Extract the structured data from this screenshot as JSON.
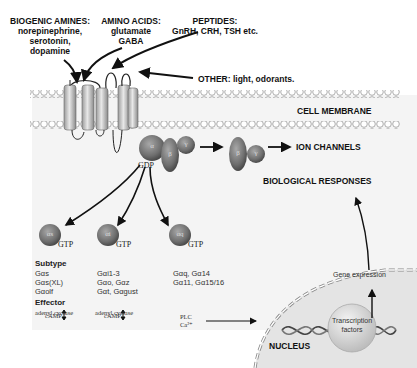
{
  "ligands": {
    "biogenic_amines": {
      "title": "BIOGENIC AMINES:",
      "items": [
        "norepinephrine,",
        "serotonin,",
        "dopamine"
      ]
    },
    "amino_acids": {
      "title": "AMINO ACIDS:",
      "items": [
        "glutamate",
        "GABA"
      ]
    },
    "peptides": {
      "title": "PEPTIDES:",
      "items": [
        "GnRH, CRH, TSH etc."
      ]
    },
    "other": {
      "text": "OTHER: light, odorants."
    }
  },
  "membrane": {
    "label": "CELL MEMBRANE"
  },
  "g_protein": {
    "alpha": "α",
    "beta": "β",
    "gamma": "γ",
    "gdp": "GDP"
  },
  "ion_channels": {
    "label": "ION CHANNELS"
  },
  "alpha_subunits": [
    {
      "symbol": "αs",
      "gtp": "GTP"
    },
    {
      "symbol": "αi",
      "gtp": "GTP"
    },
    {
      "symbol": "αq",
      "gtp": "GTP"
    }
  ],
  "subtype": {
    "heading": "Subtype",
    "columns": [
      [
        "Gαs",
        "Gαs(XL)",
        "Gαolf"
      ],
      [
        "Gαi1-3",
        "Gαo, Gαz",
        "Gαt, Gαgust"
      ],
      [
        "Gαq, Gα14",
        "Gα11, Gα15/16"
      ]
    ]
  },
  "effector": {
    "heading": "Effector",
    "columns": [
      {
        "effector": "adenyl cyclase",
        "result": "cAMP ↕"
      },
      {
        "effector": "adenyl cyclase",
        "result": "cAMP ↕"
      },
      {
        "effector": "PLC",
        "result": "Ca²⁺"
      }
    ]
  },
  "biological_responses": {
    "label": "BIOLOGICAL RESPONSES"
  },
  "nucleus": {
    "label": "NUCLEUS",
    "gene_expression": "Gene expression",
    "transcription_factors_line1": "Transcription",
    "transcription_factors_line2": "factors"
  },
  "colors": {
    "background": "#ffffff",
    "panel": "#f4f4f4",
    "membrane_bead": "#ffffff",
    "protein": "#7a7a7a",
    "nucleus": "#e2e2e2",
    "text": "#111111"
  }
}
